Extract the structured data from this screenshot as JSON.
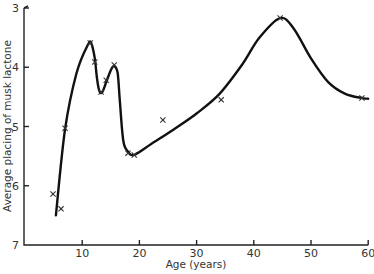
{
  "chart_data": {
    "type": "line",
    "title": "",
    "xlabel": "Age (years)",
    "ylabel": "Average placing of musk lactone",
    "xlim": [
      0,
      60
    ],
    "ylim": [
      7,
      3
    ],
    "y_inverted": true,
    "grid": false,
    "legend": null,
    "x_ticks": [
      10,
      20,
      30,
      40,
      50,
      60
    ],
    "x_tick_labels": [
      "10",
      "20",
      "30",
      "40",
      "50",
      "60"
    ],
    "y_ticks": [
      3,
      4,
      5,
      6,
      7
    ],
    "y_tick_labels": [
      "3",
      "4",
      "5",
      "6",
      "7"
    ],
    "series": [
      {
        "name": "observed",
        "marker": "x",
        "x": [
          4.9,
          6.3,
          7.0,
          11.4,
          12.2,
          13.3,
          14.2,
          15.6,
          18.0,
          19.1,
          24.1,
          34.3,
          44.6,
          58.9
        ],
        "y": [
          6.14,
          6.39,
          5.03,
          3.59,
          3.91,
          4.42,
          4.22,
          3.96,
          5.45,
          5.48,
          4.89,
          4.55,
          3.17,
          4.52
        ]
      },
      {
        "name": "fitted curve",
        "marker": "none",
        "x": [
          5.4,
          7.0,
          9.0,
          11.0,
          11.6,
          12.2,
          12.6,
          13.0,
          13.5,
          14.2,
          15.0,
          15.6,
          16.2,
          16.6,
          17.2,
          18.0,
          19.1,
          22.0,
          26.0,
          30.0,
          34.0,
          38.0,
          41.0,
          44.6,
          47.0,
          50.0,
          53.0,
          56.0,
          59.0,
          60.0
        ],
        "y": [
          6.5,
          5.05,
          4.1,
          3.62,
          3.6,
          3.85,
          4.2,
          4.4,
          4.42,
          4.25,
          4.05,
          3.98,
          4.1,
          4.6,
          5.25,
          5.42,
          5.48,
          5.3,
          5.05,
          4.78,
          4.45,
          3.95,
          3.5,
          3.17,
          3.35,
          3.85,
          4.25,
          4.45,
          4.52,
          4.53
        ]
      }
    ]
  },
  "axes": {
    "x_label": "Age (years)",
    "y_label": "Average placing of musk lactone"
  }
}
